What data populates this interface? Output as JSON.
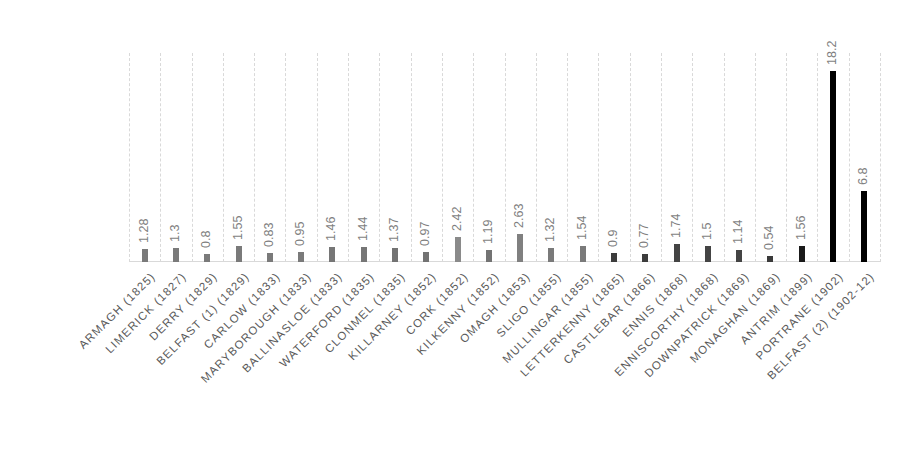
{
  "chart_data": {
    "type": "bar",
    "title": "",
    "xlabel": "",
    "ylabel": "",
    "ylim": [
      0,
      19.9
    ],
    "grid": "vertical dashed category gridlines",
    "legend": "none",
    "data_labels": "rotated -90°, above bars",
    "categories": [
      "ARMAGH (1825)",
      "LIMERICK (1827)",
      "DERRY (1829)",
      "BELFAST (1) (1829)",
      "CARLOW (1833)",
      "MARYBOROUGH (1833)",
      "BALLINASLOE (1833)",
      "WATERFORD (1835)",
      "CLONMEL (1835)",
      "KILLARNEY (1852)",
      "CORK (1852)",
      "KILKENNY (1852)",
      "OMAGH (1853)",
      "SLIGO (1855)",
      "MULLINGAR (1855)",
      "LETTERKENNY (1865)",
      "CASTLEBAR (1866)",
      "ENNIS (1868)",
      "ENNISCORTHY (1868)",
      "DOWNPATRICK (1869)",
      "MONAGHAN (1869)",
      "ANTRIM (1899)",
      "PORTRANE (1902)",
      "BELFAST (2) (1902-12)"
    ],
    "values": [
      1.28,
      1.3,
      0.8,
      1.55,
      0.83,
      0.95,
      1.46,
      1.44,
      1.37,
      0.97,
      2.42,
      1.19,
      2.63,
      1.32,
      1.54,
      0.9,
      0.77,
      1.74,
      1.5,
      1.14,
      0.54,
      1.56,
      18.2,
      6.8
    ],
    "value_labels": [
      "1.28",
      "1.3",
      "0.8",
      "1.55",
      "0.83",
      "0.95",
      "1.46",
      "1.44",
      "1.37",
      "0.97",
      "2.42",
      "1.19",
      "2.63",
      "1.32",
      "1.54",
      "0.9",
      "0.77",
      "1.74",
      "1.5",
      "1.14",
      "0.54",
      "1.56",
      "18.2",
      "6.8"
    ],
    "bar_colors": [
      "#7a7a7a",
      "#7a7a7a",
      "#7a7a7a",
      "#7a7a7a",
      "#7a7a7a",
      "#7a7a7a",
      "#767676",
      "#767676",
      "#737373",
      "#737373",
      "#8a8a8a",
      "#737373",
      "#808080",
      "#7a7a7a",
      "#7a7a7a",
      "#3c3c3c",
      "#3c3c3c",
      "#444444",
      "#444444",
      "#444444",
      "#3a3a3a",
      "#1a1a1a",
      "#000000",
      "#000000"
    ]
  }
}
